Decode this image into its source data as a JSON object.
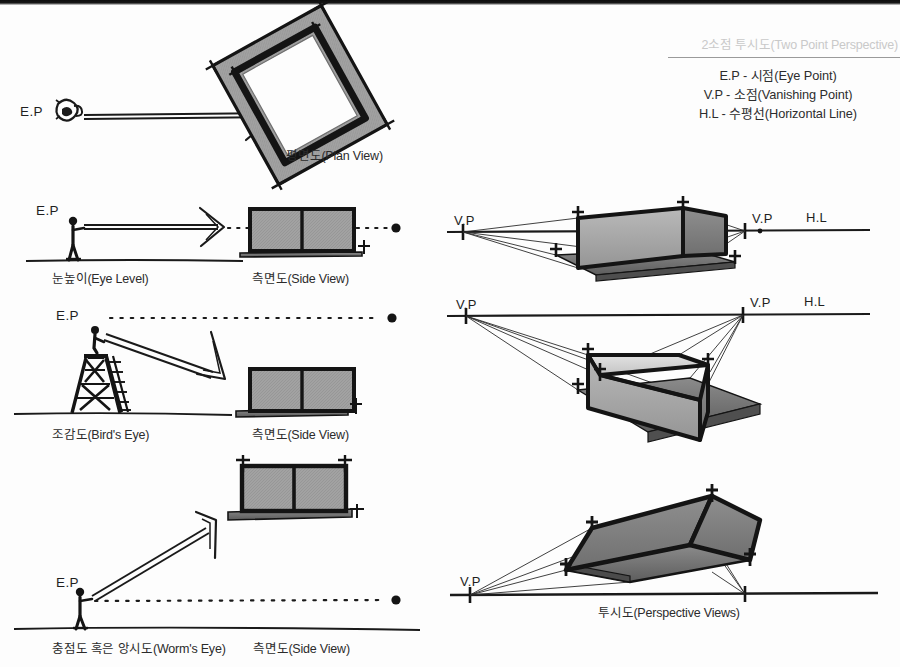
{
  "page": {
    "title": "2소점 투시도(Two Point Perspective)",
    "background_color": "#fdfdfd",
    "ink_color": "#1a1a1a",
    "fill_gray": "#9a9a9a",
    "title_color": "#c9c9c9"
  },
  "legend": {
    "title": "2소점 투시도(Two Point Perspective)",
    "items": [
      "E.P - 시점(Eye Point)",
      "V.P - 소점(Vanishing Point)",
      "H.L - 수평선(Horizontal Line)"
    ]
  },
  "labels": {
    "ep": "E.P",
    "vp": "V.P",
    "hl": "H.L",
    "plan_view": "평면도(Plan View)",
    "side_view": "측면도(Side View)",
    "eye_level": "눈높이(Eye Level)",
    "birds_eye": "조감도(Bird's Eye)",
    "worms_eye": "충점도 혹은 앙시도(Worm's Eye)",
    "perspective_views": "투시도(Perspective Views)"
  },
  "rows": [
    {
      "id": "plan",
      "left_label": "E.P",
      "caption": "평면도(Plan View)",
      "eye_icon": "eye-icon",
      "arrow": "right-arrow"
    },
    {
      "id": "eye-level",
      "left_label": "E.P",
      "ground_caption": "눈높이(Eye Level)",
      "object_caption": "측면도(Side View)",
      "figure": "standing-person",
      "sight_line": "horizontal"
    },
    {
      "id": "birds-eye",
      "left_label": "E.P",
      "ground_caption": "조감도(Bird's Eye)",
      "object_caption": "측면도(Side View)",
      "figure": "person-on-tower",
      "sight_line": "downward"
    },
    {
      "id": "worms-eye",
      "left_label": "E.P",
      "ground_caption": "충점도 혹은 앙시도(Worm's Eye)",
      "object_caption": "측면도(Side View)",
      "figure": "standing-person",
      "sight_line": "upward"
    }
  ],
  "perspectives": [
    {
      "id": "perspective-eye-level",
      "vp_left": "V.P",
      "vp_right": "V.P",
      "hl": "H.L",
      "box": "eye-level-box"
    },
    {
      "id": "perspective-birds-eye",
      "vp_left": "V.P",
      "vp_right": "V.P",
      "hl": "H.L",
      "box": "birds-eye-box"
    },
    {
      "id": "perspective-worms-eye",
      "vp_left": "V.P",
      "caption": "투시도(Perspective Views)",
      "box": "worms-eye-box"
    }
  ]
}
